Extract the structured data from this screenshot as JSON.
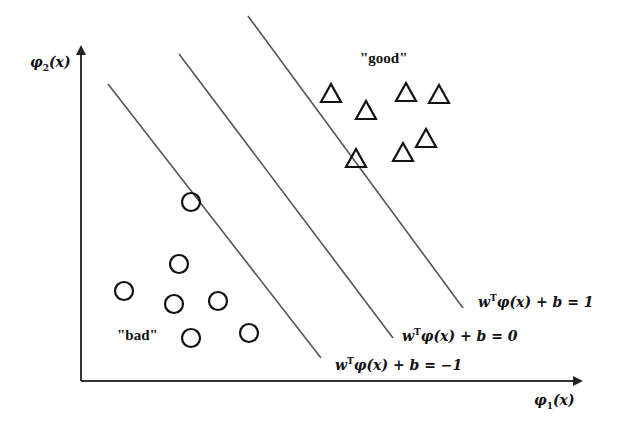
{
  "diagram": {
    "type": "svm-feature-space",
    "axes": {
      "x_label": "φ₁(x)",
      "y_label": "φ₂(x)",
      "origin": [
        81,
        381
      ],
      "x_end": [
        583,
        381
      ],
      "y_end": [
        81,
        45
      ]
    },
    "class_labels": {
      "positive": "\"good\"",
      "negative": "\"bad\""
    },
    "hyperplanes": [
      {
        "name": "margin-negative",
        "equation": "wᵀφ(x) + b = −1",
        "from": [
          108,
          84
        ],
        "to": [
          321,
          358
        ]
      },
      {
        "name": "decision-boundary",
        "equation": "wᵀφ(x) + b = 0",
        "from": [
          179,
          54
        ],
        "to": [
          393,
          338
        ]
      },
      {
        "name": "margin-positive",
        "equation": "wᵀφ(x) + b = 1",
        "from": [
          248,
          16
        ],
        "to": [
          463,
          308
        ]
      }
    ],
    "triangles": [
      [
        331,
        93
      ],
      [
        366,
        110
      ],
      [
        406,
        92
      ],
      [
        439,
        94
      ],
      [
        426,
        138
      ],
      [
        403,
        152
      ],
      [
        356,
        158
      ]
    ],
    "circles": [
      [
        191,
        202
      ],
      [
        179,
        264
      ],
      [
        124,
        291
      ],
      [
        174,
        304
      ],
      [
        218,
        301
      ],
      [
        191,
        338
      ],
      [
        249,
        333
      ]
    ],
    "colors": {
      "line": "#555555",
      "axis": "#333333",
      "marker": "#111111",
      "text": "#111111"
    }
  }
}
